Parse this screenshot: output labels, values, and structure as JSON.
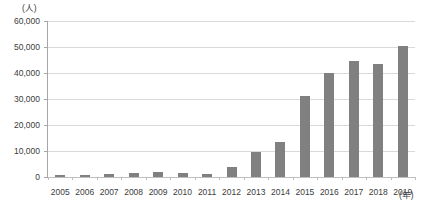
{
  "chart_data": {
    "type": "bar",
    "title": "",
    "subtitle": "",
    "xlabel": "(年)",
    "ylabel": "(人)",
    "categories": [
      "2005",
      "2006",
      "2007",
      "2008",
      "2009",
      "2010",
      "2011",
      "2012",
      "2013",
      "2014",
      "2015",
      "2016",
      "2017",
      "2018",
      "2019"
    ],
    "values": [
      700,
      800,
      1100,
      1400,
      1800,
      1400,
      1000,
      4000,
      9500,
      13500,
      31000,
      40000,
      44500,
      43500,
      50500
    ],
    "series": [
      {
        "name": "",
        "values": [
          700,
          800,
          1100,
          1400,
          1800,
          1400,
          1000,
          4000,
          9500,
          13500,
          31000,
          40000,
          44500,
          43500,
          50500
        ]
      }
    ],
    "ylim": [
      0,
      60000
    ],
    "ytick_values": [
      0,
      10000,
      20000,
      30000,
      40000,
      50000,
      60000
    ],
    "ytick_labels": [
      "0",
      "10,000",
      "20,000",
      "30,000",
      "40,000",
      "50,000",
      "60,000"
    ],
    "grid": "horizontal",
    "legend": "none",
    "bar_color": "#808080",
    "gridline_color": "#d9d9d9",
    "axis_color": "#a6a6a6",
    "background_color": "#ffffff"
  }
}
